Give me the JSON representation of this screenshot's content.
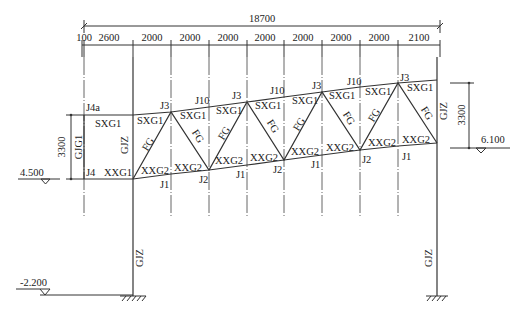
{
  "drawing": {
    "overall_dimension": "18700",
    "bay_dimensions": [
      "100",
      "2600",
      "2000",
      "2000",
      "2000",
      "2000",
      "2000",
      "2000",
      "2000",
      "2100"
    ],
    "height_dimension_left": "3300",
    "height_dimension_right": "3300",
    "elevations": {
      "left": "4.500",
      "right": "6.100",
      "ground": "-2.200"
    },
    "members": {
      "top_chord": "SXG1",
      "bottom_chord_end": "XXG1",
      "bottom_chord": "XXG2",
      "web": "FG",
      "column": "GJZ",
      "end_post": "GJG1"
    },
    "joints": {
      "j4a": "J4a",
      "j4": "J4",
      "j3": "J3",
      "j10": "J10",
      "j1": "J1",
      "j2": "J2"
    }
  }
}
